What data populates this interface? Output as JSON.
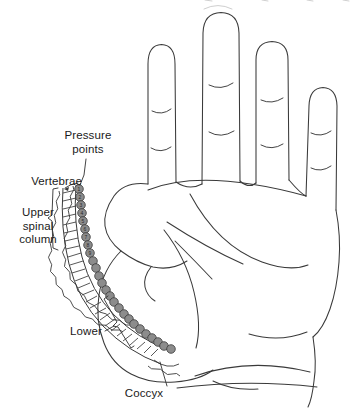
{
  "diagram": {
    "background_color": "#ffffff",
    "line_color": "#3a3a3a",
    "vertebra_fill": "#ffffff",
    "pressure_point_fill": "#8c8c8c",
    "pressure_point_stroke": "#3a3a3a"
  },
  "labels": {
    "pressure_points": "Pressure\npoints",
    "vertebrae": "Vertebrae",
    "upper_spinal_column": "Upper\nspinal\ncolumn",
    "lower": "Lower",
    "coccyx": "Coccyx"
  },
  "pressure_points": {
    "count": 26,
    "numbered_visible": [
      "1",
      "2",
      "3",
      "4",
      "5",
      "6",
      "7",
      "8",
      "9"
    ]
  },
  "hand": {
    "view": "palm",
    "fingers": [
      "index",
      "middle",
      "ring",
      "little"
    ],
    "thumb": "thumb"
  }
}
